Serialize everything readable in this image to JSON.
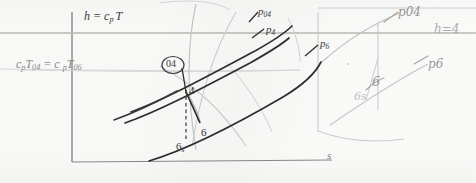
{
  "figure": {
    "kind": "hand-annotated h-s thermodynamic diagram",
    "axes": {
      "y_label": "h = c",
      "y_label_sub": "p",
      "y_label_tail": "T",
      "x_label": "s"
    },
    "left_annotation": {
      "text_1": "c",
      "sub_1": "p",
      "text_2": "T",
      "sub_2": "04",
      "eq": "= c",
      "sub_3": "p",
      "text_3": "T",
      "sub_4": "06"
    },
    "printed_labels": [
      {
        "id": "p04",
        "base": "p",
        "sub": "04",
        "x": 258,
        "y": 8
      },
      {
        "id": "p4",
        "base": "p",
        "sub": "4",
        "x": 266,
        "y": 26
      },
      {
        "id": "p6",
        "base": "p",
        "sub": "6",
        "x": 320,
        "y": 40
      },
      {
        "id": "state-04",
        "base": "04",
        "sub": "",
        "x": 166,
        "y": 58
      },
      {
        "id": "state-4",
        "base": "4",
        "sub": "",
        "x": 188,
        "y": 86
      },
      {
        "id": "state-6",
        "base": "6",
        "sub": "",
        "x": 200,
        "y": 128
      },
      {
        "id": "state-6s",
        "base": "6",
        "sub": "s",
        "x": 175,
        "y": 142
      }
    ],
    "hand_labels": [
      {
        "id": "hand-p04",
        "text": "p04",
        "x": 398,
        "y": 8
      },
      {
        "id": "hand-h04",
        "text": "h=4",
        "x": 436,
        "y": 25
      },
      {
        "id": "hand-p6",
        "text": "p6",
        "x": 428,
        "y": 60
      },
      {
        "id": "hand-6",
        "text": "6",
        "x": 372,
        "y": 77
      },
      {
        "id": "hand-6s",
        "text": "6s",
        "x": 355,
        "y": 92
      }
    ],
    "colors": {
      "ink_dark": "#2f2f2f",
      "ink_mid": "#6f6f6f",
      "ink_faint": "#bdbdbd",
      "ink_pencil": "#a6a6a6",
      "paper": "#fdfdfc"
    },
    "curves": {
      "p04_line": "M132,111 C166,98 206,76 256,50 C272,41 286,32 292,26",
      "p4_line": "M126,122 C160,110 202,88 252,62 C268,53 282,44 290,38",
      "p6_line": "M150,160 C190,148 236,124 284,96 C304,84 316,72 322,62",
      "short_iso": "M118,118 C140,110 160,100 178,90",
      "process_4_6": "M186,92 L200,123",
      "dashed_4_6s": "M186,92 L186,138",
      "tick_04_4": "M182,68 L186,92",
      "base_curve_right": "M330,140 C346,126 360,114 380,100 C400,86 418,74 434,66",
      "top_faint_arc": "M160,4 C186,0 214,2 228,10",
      "right_box_top": "M318,10 L476,10",
      "right_vert": "M318,12 L318,130",
      "right_bot": "M318,130 C344,140 372,142 402,138",
      "right_arc_04": "M322,62 C340,44 366,26 398,14",
      "right_arc_p6": "M330,124 C356,106 386,86 424,66",
      "right_inner_v": "M378,20 L378,108",
      "right_diag": "M378,60 L366,100"
    }
  }
}
